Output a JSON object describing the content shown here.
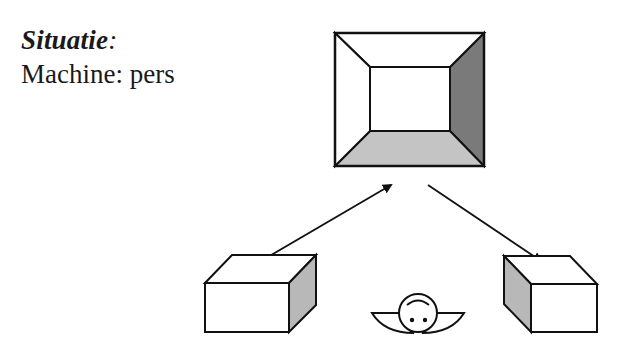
{
  "slide": {
    "heading": "Situatie",
    "heading_suffix": ":",
    "body_line": "Machine: pers"
  },
  "diagram": {
    "machine_label": "pers",
    "elements": [
      {
        "name": "press-machine",
        "shape": "beveled-frame"
      },
      {
        "name": "input-box",
        "shape": "3d-box",
        "position": "left"
      },
      {
        "name": "output-box",
        "shape": "3d-box",
        "position": "right"
      },
      {
        "name": "operator",
        "shape": "top-view-person"
      },
      {
        "name": "arrow-to-press",
        "from": "input-box",
        "to": "press-machine"
      },
      {
        "name": "arrow-to-output",
        "from": "press-machine",
        "to": "output-box"
      }
    ],
    "colors": {
      "stroke": "#111111",
      "dark_bevel": "#7a7a7a",
      "light_bevel": "#c4c4c4",
      "box_side": "#b8b8b8",
      "face": "#ffffff"
    }
  }
}
